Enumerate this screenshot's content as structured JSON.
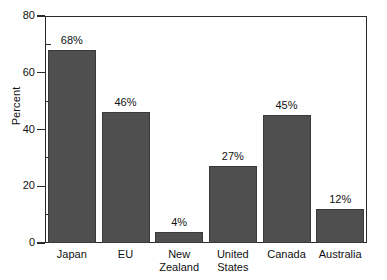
{
  "chart_data": {
    "type": "bar",
    "title": "",
    "xlabel": "",
    "ylabel": "Percent",
    "ylim": [
      0,
      80
    ],
    "ytick_labels": [
      "0",
      "20",
      "40",
      "60",
      "80"
    ],
    "ytick_values": [
      0,
      20,
      40,
      60,
      80
    ],
    "yminor_values": [
      10,
      30,
      50,
      70
    ],
    "grid": false,
    "legend": false,
    "categories": [
      "Japan",
      "EU",
      "New Zealand",
      "United States",
      "Canada",
      "Australia"
    ],
    "values": [
      68,
      46,
      4,
      27,
      45,
      12
    ],
    "data_labels": [
      "68%",
      "46%",
      "4%",
      "27%",
      "45%",
      "12%"
    ],
    "bar_color": "#4f4f4f",
    "frame_color": "#2a2a2a",
    "background": "#ffffff"
  },
  "axis": {
    "y_title": "Percent",
    "ticks": [
      {
        "label": "80",
        "value": 80
      },
      {
        "label": "60",
        "value": 60
      },
      {
        "label": "40",
        "value": 40
      },
      {
        "label": "20",
        "value": 20
      },
      {
        "label": "0",
        "value": 0
      }
    ]
  },
  "bars": [
    {
      "category_line1": "Japan",
      "category_line2": "",
      "label": "68%",
      "value": 68
    },
    {
      "category_line1": "EU",
      "category_line2": "",
      "label": "46%",
      "value": 46
    },
    {
      "category_line1": "New",
      "category_line2": "Zealand",
      "label": "4%",
      "value": 4
    },
    {
      "category_line1": "United",
      "category_line2": "States",
      "label": "27%",
      "value": 27
    },
    {
      "category_line1": "Canada",
      "category_line2": "",
      "label": "45%",
      "value": 45
    },
    {
      "category_line1": "Australia",
      "category_line2": "",
      "label": "12%",
      "value": 12
    }
  ]
}
